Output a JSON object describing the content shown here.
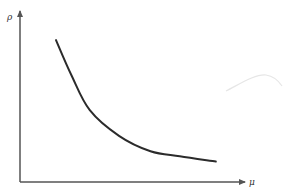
{
  "chart_data": {
    "type": "line",
    "title": "",
    "xlabel": "μ",
    "ylabel": "ρ",
    "grid": false,
    "legend": null,
    "ticks": {
      "x": [],
      "y": []
    },
    "series": [
      {
        "name": "ρ(μ)",
        "x": [
          0.16,
          0.23,
          0.31,
          0.44,
          0.58,
          0.71,
          0.87
        ],
        "y": [
          0.83,
          0.62,
          0.42,
          0.27,
          0.18,
          0.15,
          0.12
        ]
      }
    ],
    "xlim": [
      0,
      1
    ],
    "ylim": [
      0,
      1
    ]
  },
  "colors": {
    "curve": "#2b2b2b",
    "axis": "#555555",
    "artifact": "#e6e6e6"
  }
}
